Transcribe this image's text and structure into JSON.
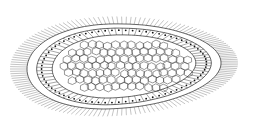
{
  "figure": {
    "labels": [],
    "colors": {
      "background": "#ffffff",
      "stroke": "#222222",
      "cilia": "#888888",
      "nuclei": "#111111"
    },
    "outer_body": {
      "cx": 124,
      "cy": 66,
      "rx": 97,
      "ry": 42
    },
    "inner_body": {
      "cx": 130,
      "cy": 66,
      "rx": 73,
      "ry": 24
    },
    "cilia_length": 14,
    "cilia_count": 150,
    "ectoderm_cells": 75
  }
}
